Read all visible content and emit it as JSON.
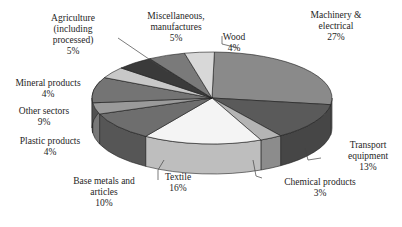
{
  "chart_data": {
    "type": "pie",
    "style": "3d-exploded-oblique",
    "title": "",
    "legend": "none (slice labels with leader lines)",
    "slices": [
      {
        "label": "Machinery & electrical",
        "lines": [
          "Machinery &",
          "electrical"
        ],
        "value": 27,
        "pct": "27%"
      },
      {
        "label": "Transport equipment",
        "lines": [
          "Transport",
          "equipment"
        ],
        "value": 13,
        "pct": "13%"
      },
      {
        "label": "Chemical products",
        "lines": [
          "Chemical products"
        ],
        "value": 3,
        "pct": "3%"
      },
      {
        "label": "Textile",
        "lines": [
          "Textile"
        ],
        "value": 16,
        "pct": "16%"
      },
      {
        "label": "Base metals and articles",
        "lines": [
          "Base metals and",
          "articles"
        ],
        "value": 10,
        "pct": "10%"
      },
      {
        "label": "Plastic products",
        "lines": [
          "Plastic products"
        ],
        "value": 4,
        "pct": "4%"
      },
      {
        "label": "Other sectors",
        "lines": [
          "Other sectors"
        ],
        "value": 9,
        "pct": "9%"
      },
      {
        "label": "Mineral products",
        "lines": [
          "Mineral products"
        ],
        "value": 4,
        "pct": "4%"
      },
      {
        "label": "Agriculture (including processed)",
        "lines": [
          "Agriculture",
          "(including",
          "processed)"
        ],
        "value": 5,
        "pct": "5%"
      },
      {
        "label": "Miscellaneous, manufactures",
        "lines": [
          "Miscellaneous,",
          "manufactures"
        ],
        "value": 5,
        "pct": "5%"
      },
      {
        "label": "Wood",
        "lines": [
          "Wood"
        ],
        "value": 4,
        "pct": "4%"
      }
    ]
  },
  "colors": {
    "machinery": "#8a8a8a",
    "transport": "#5a5a5a",
    "chemical": "#b4b4b4",
    "textile": "#f4f4f4",
    "base_metals": "#6e6e6e",
    "plastic": "#9a9a9a",
    "other": "#747474",
    "mineral": "#c8c8c8",
    "agriculture": "#3a3a3a",
    "misc": "#7a7a7a",
    "wood": "#d8d8d8"
  }
}
